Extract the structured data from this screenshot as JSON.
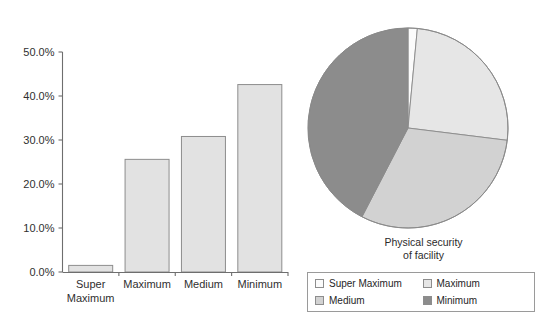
{
  "chart_data": [
    {
      "type": "bar",
      "title": "",
      "xlabel": "",
      "ylabel": "",
      "categories": [
        "Super Maximum",
        "Maximum",
        "Medium",
        "Minimum"
      ],
      "category_lines": [
        [
          "Super",
          "Maximum"
        ],
        [
          "Maximum"
        ],
        [
          "Medium"
        ],
        [
          "Minimum"
        ]
      ],
      "values": [
        1.5,
        25.6,
        30.8,
        42.6
      ],
      "ylim": [
        0,
        50
      ],
      "ytick_values": [
        0,
        10,
        20,
        30,
        40,
        50
      ],
      "ytick_labels": [
        "0.0%",
        "10.0%",
        "20.0%",
        "30.0%",
        "40.0%",
        "50.0%"
      ],
      "grid": false,
      "legend_position": "none",
      "bar_fill": "#e2e2e2",
      "bar_stroke": "#8d8d8d"
    },
    {
      "type": "pie",
      "title": "Physical security of facility",
      "title_lines": [
        "Physical security",
        "of facility"
      ],
      "labels": [
        "Super Maximum",
        "Maximum",
        "Medium",
        "Minimum"
      ],
      "values": [
        1.5,
        25.6,
        30.8,
        42.6
      ],
      "colors": [
        "#fbfbfb",
        "#e6e6e6",
        "#d2d2d2",
        "#8c8c8c"
      ],
      "start_angle": 0,
      "direction": "clockwise",
      "legend_position": "bottom"
    }
  ],
  "bar_chart": {
    "name": "security-level-bar-chart",
    "ytick_labels": [
      "50.0%",
      "40.0%",
      "30.0%",
      "20.0%",
      "10.0%",
      "0.0%"
    ],
    "xtick_labels": [
      "Super",
      "Maximum",
      "Maximum",
      "Medium",
      "Minimum"
    ]
  },
  "pie_chart": {
    "name": "physical-security-pie-chart",
    "caption_line1": "Physical security",
    "caption_line2": "of facility",
    "legend": [
      {
        "label": "Super Maximum",
        "color": "#fbfbfb"
      },
      {
        "label": "Maximum",
        "color": "#e6e6e6"
      },
      {
        "label": "Medium",
        "color": "#d2d2d2"
      },
      {
        "label": "Minimum",
        "color": "#8c8c8c"
      }
    ]
  }
}
